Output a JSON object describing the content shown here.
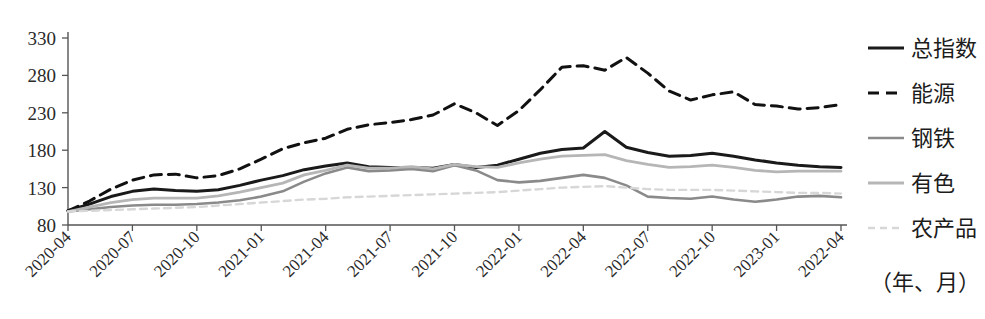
{
  "chart_data": {
    "type": "line",
    "title": "",
    "subtitle": "",
    "xlabel": "（年、月）",
    "ylabel": "",
    "ylim": [
      80,
      330
    ],
    "yticks": [
      80,
      130,
      180,
      230,
      280,
      330
    ],
    "grid": false,
    "legend_position": "right",
    "x": [
      "2020-04",
      "2020-05",
      "2020-06",
      "2020-07",
      "2020-08",
      "2020-09",
      "2020-10",
      "2020-11",
      "2020-12",
      "2021-01",
      "2021-02",
      "2021-03",
      "2021-04",
      "2021-05",
      "2021-06",
      "2021-07",
      "2021-08",
      "2021-09",
      "2021-10",
      "2021-11",
      "2021-12",
      "2022-01",
      "2022-02",
      "2022-03",
      "2022-04",
      "2022-05",
      "2022-06",
      "2022-07",
      "2022-08",
      "2022-09",
      "2022-10",
      "2022-11",
      "2022-12",
      "2023-01",
      "2023-02",
      "2023-03",
      "2023-04"
    ],
    "xtick_labels": [
      "2020-04",
      "2020-07",
      "2020-10",
      "2021-01",
      "2021-04",
      "2021-07",
      "2021-10",
      "2022-01",
      "2022-04",
      "2022-07",
      "2022-10",
      "2023-01",
      "2022-04"
    ],
    "xtick_indices": [
      0,
      3,
      6,
      9,
      12,
      15,
      18,
      21,
      24,
      27,
      30,
      33,
      36
    ],
    "series": [
      {
        "name": "总指数",
        "color": "#1a1a1a",
        "width": 3.0,
        "dash": "none",
        "values": [
          99,
          108,
          118,
          125,
          128,
          126,
          125,
          127,
          133,
          140,
          146,
          154,
          159,
          163,
          158,
          157,
          157,
          156,
          161,
          157,
          160,
          168,
          176,
          181,
          183,
          205,
          184,
          177,
          172,
          173,
          176,
          172,
          167,
          163,
          160,
          158,
          157
        ]
      },
      {
        "name": "能源",
        "color": "#111111",
        "width": 3.0,
        "dash": "11,7",
        "values": [
          99,
          112,
          128,
          140,
          147,
          148,
          143,
          146,
          155,
          168,
          182,
          190,
          196,
          208,
          214,
          217,
          221,
          227,
          242,
          230,
          213,
          233,
          261,
          291,
          293,
          287,
          304,
          283,
          259,
          247,
          254,
          258,
          241,
          239,
          235,
          237,
          241
        ]
      },
      {
        "name": "钢铁",
        "color": "#8a8a8a",
        "width": 2.6,
        "dash": "none",
        "values": [
          98,
          101,
          104,
          106,
          107,
          107,
          108,
          110,
          113,
          118,
          125,
          138,
          149,
          157,
          152,
          153,
          155,
          152,
          160,
          153,
          140,
          137,
          139,
          143,
          147,
          143,
          133,
          118,
          116,
          115,
          118,
          114,
          111,
          114,
          118,
          119,
          117
        ]
      },
      {
        "name": "有色",
        "color": "#b6b6b6",
        "width": 2.8,
        "dash": "none",
        "values": [
          98,
          104,
          110,
          114,
          116,
          116,
          116,
          119,
          124,
          130,
          136,
          147,
          153,
          160,
          156,
          156,
          158,
          155,
          161,
          158,
          157,
          163,
          168,
          172,
          173,
          174,
          166,
          161,
          157,
          158,
          160,
          157,
          153,
          151,
          152,
          152,
          152
        ]
      },
      {
        "name": "农产品",
        "color": "#d7d7d7",
        "width": 2.4,
        "dash": "7,5",
        "values": [
          98,
          99,
          100,
          101,
          102,
          103,
          104,
          106,
          108,
          110,
          112,
          114,
          115,
          117,
          118,
          119,
          120,
          121,
          122,
          123,
          124,
          126,
          128,
          130,
          131,
          132,
          130,
          128,
          127,
          127,
          127,
          126,
          125,
          124,
          123,
          123,
          122
        ]
      }
    ]
  },
  "legend": {
    "items": [
      {
        "label": "总指数"
      },
      {
        "label": "能源"
      },
      {
        "label": "钢铁"
      },
      {
        "label": "有色"
      },
      {
        "label": "农产品"
      }
    ],
    "axis_note": "（年、月）"
  }
}
